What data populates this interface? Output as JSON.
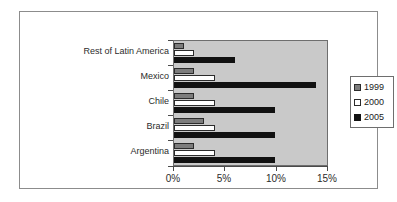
{
  "chart_data": {
    "type": "bar",
    "orientation": "horizontal",
    "title": "",
    "xlabel": "",
    "ylabel": "",
    "categories": [
      "Argentina",
      "Brazil",
      "Chile",
      "Mexico",
      "Rest of Latin America"
    ],
    "series": [
      {
        "name": "1999",
        "color": "#7c7c7c",
        "values": [
          2,
          3,
          2,
          2,
          1
        ]
      },
      {
        "name": "2000",
        "color": "#ffffff",
        "values": [
          4,
          4,
          4,
          4,
          2
        ]
      },
      {
        "name": "2005",
        "color": "#111111",
        "values": [
          10,
          10,
          10,
          14,
          6
        ]
      }
    ],
    "xlim": [
      0,
      15
    ],
    "xticks": [
      0,
      5,
      10,
      15
    ],
    "xtick_labels": [
      "0%",
      "5%",
      "10%",
      "15%"
    ],
    "grid": false,
    "legend_position": "right",
    "plot_background": "#c9c9c9",
    "frame_border": "#8c8c8c"
  },
  "legend": {
    "items": [
      {
        "label": "1999"
      },
      {
        "label": "2000"
      },
      {
        "label": "2005"
      }
    ]
  }
}
